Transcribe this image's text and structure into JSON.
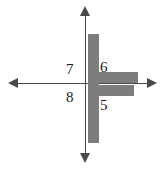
{
  "figure": {
    "type": "coordinate-plane-diagram",
    "width": 165,
    "height": 169,
    "background_color": "#ffffff",
    "axis_color": "#4a4a4a",
    "shape_color": "#7d7d7d",
    "label_color": "#1a1a1a"
  },
  "axes": {
    "horizontal": {
      "name": "x-axis",
      "y_position": 83,
      "left_arrow": "arrow-left",
      "right_arrow": "arrow-right"
    },
    "vertical": {
      "name": "y-axis",
      "x_position": 85,
      "up_arrow": "arrow-up",
      "down_arrow": "arrow-down"
    }
  },
  "labels": [
    {
      "id": "q2",
      "text": "7",
      "quadrant": "upper-left"
    },
    {
      "id": "q1",
      "text": "6",
      "quadrant": "upper-right"
    },
    {
      "id": "q3",
      "text": "8",
      "quadrant": "lower-left"
    },
    {
      "id": "q4",
      "text": "5",
      "quadrant": "lower-right"
    }
  ],
  "shape": {
    "description": "gray cross / plus figure",
    "parts": [
      {
        "id": "vertical",
        "name": "vertical-bar"
      },
      {
        "id": "arm_upper",
        "name": "upper-right-arm"
      },
      {
        "id": "arm_lower",
        "name": "lower-right-arm"
      }
    ]
  }
}
